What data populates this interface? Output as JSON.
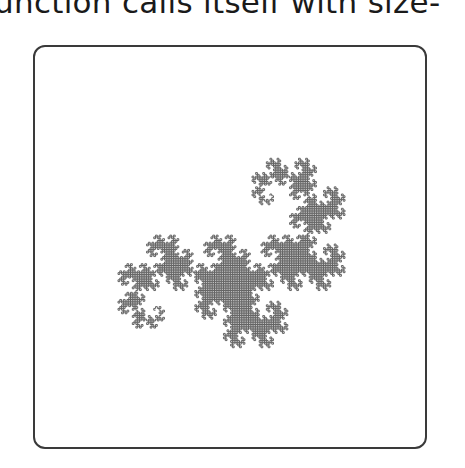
{
  "caption": "unction calls itself with size-",
  "figure": {
    "type": "dragon-curve",
    "order": 13,
    "stroke_color": "#555555",
    "frame_color": "#3a3a3a",
    "bbox": {
      "x0": 118,
      "y0": 86,
      "x1": 345,
      "y1": 420
    }
  }
}
